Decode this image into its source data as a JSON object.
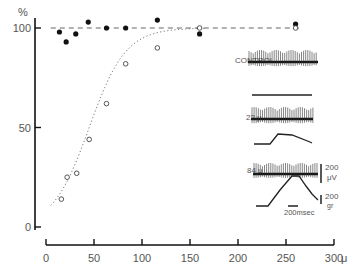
{
  "chart_data": {
    "type": "scatter",
    "title": "",
    "xlabel": "",
    "ylabel": "%",
    "x_unit": "μ",
    "xlim": [
      0,
      300
    ],
    "ylim": [
      0,
      100
    ],
    "x_ticks": [
      0,
      50,
      100,
      150,
      200,
      250,
      300
    ],
    "x_tick_labels": [
      "0",
      "50",
      "100",
      "150",
      "200",
      "250",
      "300"
    ],
    "y_ticks": [
      0,
      50,
      100
    ],
    "y_tick_labels": [
      "0",
      "50",
      "100"
    ],
    "grid": false,
    "reference_line": {
      "y": 100,
      "style": "dashed"
    },
    "series": [
      {
        "name": "filled",
        "marker": "filled-circle",
        "points": [
          [
            14,
            98
          ],
          [
            21,
            93
          ],
          [
            31,
            97
          ],
          [
            44,
            103
          ],
          [
            63,
            100
          ],
          [
            83,
            100
          ],
          [
            116,
            104
          ],
          [
            160,
            97
          ],
          [
            260,
            102
          ]
        ]
      },
      {
        "name": "open",
        "marker": "open-circle",
        "points": [
          [
            16,
            14
          ],
          [
            22,
            25
          ],
          [
            32,
            27
          ],
          [
            45,
            44
          ],
          [
            63,
            62
          ],
          [
            83,
            82
          ],
          [
            116,
            90
          ],
          [
            160,
            100
          ],
          [
            260,
            100
          ]
        ],
        "fit_curve": "dotted sigmoid"
      }
    ],
    "inset": {
      "traces": [
        {
          "label": "CONTROL"
        },
        {
          "label": "22 μ"
        },
        {
          "label": "84 μ"
        }
      ],
      "scale_bars": {
        "voltage": {
          "value": "200",
          "unit": "μV"
        },
        "force": {
          "value": "200",
          "unit": "gr"
        },
        "time": {
          "label": "200msec"
        }
      }
    }
  }
}
